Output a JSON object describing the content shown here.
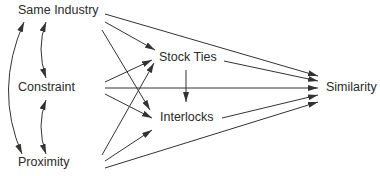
{
  "diagram": {
    "type": "path-diagram",
    "nodes": {
      "same_industry": "Same Industry",
      "constraint": "Constraint",
      "proximity": "Proximity",
      "stock_ties": "Stock Ties",
      "interlocks": "Interlocks",
      "similarity": "Similarity"
    },
    "edges": [
      {
        "from": "Same Industry",
        "to": "Similarity"
      },
      {
        "from": "Same Industry",
        "to": "Stock Ties"
      },
      {
        "from": "Same Industry",
        "to": "Interlocks"
      },
      {
        "from": "Constraint",
        "to": "Stock Ties"
      },
      {
        "from": "Constraint",
        "to": "Interlocks"
      },
      {
        "from": "Constraint",
        "to": "Similarity"
      },
      {
        "from": "Proximity",
        "to": "Stock Ties"
      },
      {
        "from": "Proximity",
        "to": "Interlocks"
      },
      {
        "from": "Proximity",
        "to": "Similarity"
      },
      {
        "from": "Stock Ties",
        "to": "Interlocks"
      },
      {
        "from": "Stock Ties",
        "to": "Similarity"
      },
      {
        "from": "Interlocks",
        "to": "Similarity"
      }
    ],
    "correlations": [
      {
        "between": [
          "Same Industry",
          "Constraint"
        ]
      },
      {
        "between": [
          "Constraint",
          "Proximity"
        ]
      },
      {
        "between": [
          "Same Industry",
          "Proximity"
        ]
      }
    ],
    "colors": {
      "line": "#333333",
      "text": "#2a2a2a",
      "background": "#ffffff"
    }
  }
}
